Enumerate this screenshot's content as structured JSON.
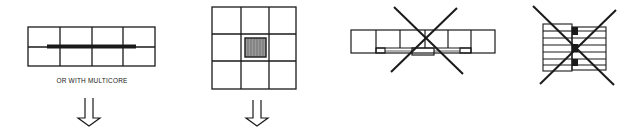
{
  "figures": [
    {
      "id": "panel-row-strip",
      "description": "2x4 panel strip with thick horizontal bar across middle line",
      "caption": "OR WITH MULTICORE",
      "arrow": "down-arrow",
      "crossed_out": false
    },
    {
      "id": "panel-grid-3x3",
      "description": "3x3 panel grid with hatched square in center cell",
      "arrow": "down-arrow",
      "crossed_out": false
    },
    {
      "id": "panel-strip-with-tabs",
      "description": "single row of 6 cells with bottom connector tabs",
      "crossed_out": true
    },
    {
      "id": "stacked-layers",
      "description": "stacked horizontal layers with black connector blocks",
      "crossed_out": true
    }
  ],
  "colors": {
    "line": "#1a1a1a",
    "hatch_fill": "#9a9a9a",
    "background": "#ffffff"
  }
}
